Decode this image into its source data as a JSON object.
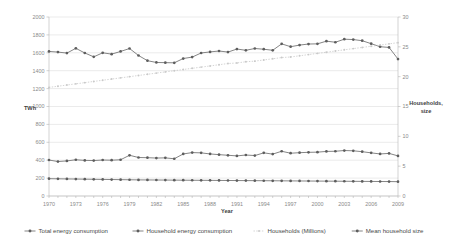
{
  "chart_data": {
    "type": "line",
    "title": "",
    "xlabel": "Year",
    "ylabel": "TWh",
    "y2label": "Households, size",
    "x": [
      1970,
      1971,
      1972,
      1973,
      1974,
      1975,
      1976,
      1977,
      1978,
      1979,
      1980,
      1981,
      1982,
      1983,
      1984,
      1985,
      1986,
      1987,
      1988,
      1989,
      1990,
      1991,
      1992,
      1993,
      1994,
      1995,
      1996,
      1997,
      1998,
      1999,
      2000,
      2001,
      2002,
      2003,
      2004,
      2005,
      2006,
      2007,
      2008,
      2009
    ],
    "xtick_labels": [
      "1970",
      "1973",
      "1976",
      "1979",
      "1982",
      "1985",
      "1988",
      "1991",
      "1994",
      "1997",
      "2000",
      "2003",
      "2006",
      "2009"
    ],
    "ylim": [
      0,
      2000
    ],
    "ytick_labels": [
      "0",
      "200",
      "400",
      "600",
      "800",
      "1000",
      "1200",
      "1400",
      "1600",
      "1800",
      "2000"
    ],
    "y2lim": [
      0,
      30
    ],
    "y2tick_labels": [
      "0",
      "5",
      "10",
      "15",
      "20",
      "25",
      "30"
    ],
    "grid": true,
    "legend_position": "bottom",
    "series": [
      {
        "name": "Total energy consumption",
        "axis": "left",
        "units": "TWh",
        "style": "solid-dark",
        "values": [
          1615,
          1608,
          1597,
          1650,
          1598,
          1555,
          1600,
          1585,
          1615,
          1648,
          1570,
          1512,
          1492,
          1490,
          1488,
          1536,
          1552,
          1598,
          1610,
          1620,
          1608,
          1642,
          1628,
          1648,
          1640,
          1628,
          1700,
          1668,
          1686,
          1698,
          1700,
          1730,
          1718,
          1752,
          1748,
          1735,
          1702,
          1668,
          1660,
          1530
        ]
      },
      {
        "name": "Household energy consumption",
        "axis": "left",
        "units": "TWh",
        "style": "solid-dark",
        "values": [
          402,
          385,
          392,
          405,
          398,
          396,
          402,
          400,
          405,
          455,
          430,
          428,
          424,
          426,
          416,
          470,
          485,
          482,
          470,
          462,
          455,
          448,
          458,
          452,
          482,
          468,
          500,
          478,
          484,
          488,
          490,
          498,
          500,
          508,
          505,
          495,
          482,
          470,
          476,
          448
        ]
      },
      {
        "name": "Households (Millions)",
        "axis": "right",
        "units": "millions",
        "style": "dotted-light",
        "values": [
          18.2,
          18.4,
          18.6,
          18.8,
          19.0,
          19.2,
          19.4,
          19.6,
          19.8,
          20.0,
          20.2,
          20.4,
          20.6,
          20.8,
          21.0,
          21.2,
          21.4,
          21.6,
          21.8,
          22.0,
          22.2,
          22.3,
          22.5,
          22.6,
          22.8,
          23.0,
          23.2,
          23.3,
          23.5,
          23.7,
          23.9,
          24.1,
          24.3,
          24.5,
          24.7,
          24.9,
          25.1,
          25.3,
          25.5,
          25.7
        ]
      },
      {
        "name": "Mean household size",
        "axis": "right",
        "units": "persons",
        "style": "solid-dark",
        "values": [
          2.9,
          2.88,
          2.86,
          2.84,
          2.82,
          2.8,
          2.78,
          2.76,
          2.74,
          2.72,
          2.7,
          2.69,
          2.68,
          2.67,
          2.66,
          2.65,
          2.64,
          2.63,
          2.62,
          2.61,
          2.6,
          2.59,
          2.58,
          2.57,
          2.56,
          2.55,
          2.54,
          2.53,
          2.52,
          2.51,
          2.5,
          2.49,
          2.48,
          2.47,
          2.46,
          2.45,
          2.44,
          2.43,
          2.42,
          2.4
        ]
      }
    ]
  },
  "legend": {
    "items": [
      {
        "label": "Total energy consumption",
        "style": "solid-dark"
      },
      {
        "label": "Household energy consumption",
        "style": "solid-dark"
      },
      {
        "label": "Households (Millions)",
        "style": "dotted-light"
      },
      {
        "label": "Mean household size",
        "style": "solid-dark"
      }
    ]
  }
}
